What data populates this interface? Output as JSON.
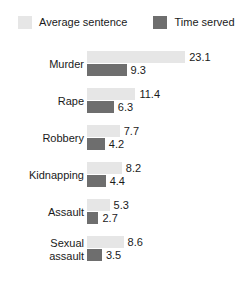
{
  "chart_data": {
    "type": "bar",
    "orientation": "horizontal",
    "title": "",
    "subtitle": "",
    "xlabel": "",
    "ylabel": "",
    "grid": false,
    "axes_visible": false,
    "legend_position": "top",
    "value_labels": true,
    "xlim": [
      0,
      23.1
    ],
    "categories": [
      "Murder",
      "Rape",
      "Robbery",
      "Kidnapping",
      "Assault",
      "Sexual\nassault"
    ],
    "series": [
      {
        "name": "Average sentence",
        "color": "#e6e6e6",
        "values": [
          23.1,
          11.4,
          7.7,
          8.2,
          5.3,
          8.6
        ]
      },
      {
        "name": "Time served",
        "color": "#6e6e6e",
        "values": [
          9.3,
          6.3,
          4.2,
          4.4,
          2.7,
          3.5
        ]
      }
    ]
  },
  "legend": {
    "items": [
      {
        "label": "Average sentence",
        "color": "#e6e6e6"
      },
      {
        "label": "Time served",
        "color": "#6e6e6e"
      }
    ]
  },
  "scale": {
    "pixels_per_unit": 4.25
  }
}
